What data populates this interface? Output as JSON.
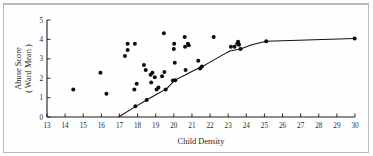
{
  "figure": {
    "background_color": "#fefefe",
    "border_color": "#b9b9b9",
    "point_color": "#0d0d0d",
    "curve_color": "#111111",
    "axis_color": "#1a1a1a"
  },
  "chart_data": {
    "type": "scatter",
    "title": "",
    "xlabel": "Child Density",
    "ylabel_line1": "Abuse Score",
    "ylabel_line2": "( Ward Mean )",
    "xlim": [
      13,
      30
    ],
    "ylim": [
      0,
      5
    ],
    "grid": false,
    "legend": "none",
    "xticks": [
      13,
      14,
      15,
      16,
      17,
      18,
      19,
      20,
      21,
      22,
      23,
      24,
      25,
      26,
      27,
      28,
      29,
      30
    ],
    "xticklabels": [
      "13",
      "14",
      "15",
      "16",
      "17",
      "18",
      "19",
      "20",
      "21",
      "22",
      "23",
      "24",
      "25",
      "26",
      "27",
      "28",
      "29",
      "30"
    ],
    "yticks": [
      0,
      1,
      2,
      3,
      4,
      5
    ],
    "yticklabels": [
      "0",
      "1",
      "2",
      "3",
      "4",
      "5"
    ],
    "points": [
      [
        14.45,
        1.42
      ],
      [
        15.95,
        2.28
      ],
      [
        16.28,
        1.2
      ],
      [
        17.3,
        3.15
      ],
      [
        17.45,
        3.45
      ],
      [
        17.45,
        3.78
      ],
      [
        17.82,
        1.42
      ],
      [
        17.85,
        3.78
      ],
      [
        17.88,
        0.55
      ],
      [
        17.95,
        1.72
      ],
      [
        18.35,
        2.68
      ],
      [
        18.45,
        2.42
      ],
      [
        18.5,
        0.88
      ],
      [
        18.72,
        2.18
      ],
      [
        18.75,
        1.78
      ],
      [
        18.82,
        2.28
      ],
      [
        18.95,
        2.05
      ],
      [
        19.05,
        1.42
      ],
      [
        19.15,
        1.52
      ],
      [
        19.35,
        2.1
      ],
      [
        19.45,
        4.32
      ],
      [
        19.48,
        2.32
      ],
      [
        19.55,
        1.42
      ],
      [
        19.95,
        1.88
      ],
      [
        20.0,
        3.5
      ],
      [
        20.02,
        3.78
      ],
      [
        20.05,
        2.8
      ],
      [
        20.08,
        1.9
      ],
      [
        20.6,
        4.12
      ],
      [
        20.62,
        3.62
      ],
      [
        20.65,
        2.42
      ],
      [
        20.78,
        3.78
      ],
      [
        20.82,
        3.7
      ],
      [
        21.35,
        2.9
      ],
      [
        21.45,
        2.5
      ],
      [
        21.55,
        2.6
      ],
      [
        22.2,
        4.12
      ],
      [
        23.15,
        3.62
      ],
      [
        23.35,
        3.62
      ],
      [
        23.5,
        3.78
      ],
      [
        23.55,
        3.88
      ],
      [
        23.6,
        3.72
      ],
      [
        23.68,
        3.5
      ],
      [
        25.1,
        3.9
      ],
      [
        29.98,
        4.05
      ]
    ],
    "fit_curve": {
      "name": "fitted-trend",
      "points": [
        [
          16.95,
          0.0
        ],
        [
          17.9,
          0.55
        ],
        [
          18.5,
          0.88
        ],
        [
          19.1,
          1.2
        ],
        [
          19.6,
          1.45
        ],
        [
          20.05,
          1.9
        ],
        [
          20.6,
          2.15
        ],
        [
          21.1,
          2.4
        ],
        [
          21.6,
          2.62
        ],
        [
          22.1,
          2.88
        ],
        [
          22.6,
          3.15
        ],
        [
          23.1,
          3.4
        ],
        [
          23.68,
          3.5
        ],
        [
          24.3,
          3.72
        ],
        [
          25.1,
          3.9
        ],
        [
          29.98,
          4.05
        ]
      ]
    }
  }
}
